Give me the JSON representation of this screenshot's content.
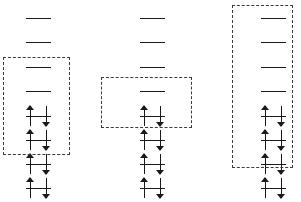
{
  "figure": {
    "width": 301,
    "height": 202,
    "background_color": "#ffffff",
    "line_color": "#1a1a1a",
    "dash_color": "#3a3a3a",
    "level_count_per_column": 8,
    "level_spacing_px": 24.3,
    "level_y_positions": [
      18,
      42,
      67,
      91,
      116,
      140,
      164,
      188
    ],
    "occupancy_legend": {
      "empty": "horizontal line with no electrons",
      "paired": "horizontal line crossed by one up-spin and one down-spin arrow"
    }
  },
  "columns": [
    {
      "id": "column-1",
      "label": "Diagram 1",
      "center_x": 38,
      "line_width": 25,
      "levels": [
        {
          "index": 1,
          "occupancy": "empty",
          "electrons": 0,
          "spins": ""
        },
        {
          "index": 2,
          "occupancy": "empty",
          "electrons": 0,
          "spins": ""
        },
        {
          "index": 3,
          "occupancy": "empty",
          "electrons": 0,
          "spins": ""
        },
        {
          "index": 4,
          "occupancy": "empty",
          "electrons": 0,
          "spins": ""
        },
        {
          "index": 5,
          "occupancy": "paired",
          "electrons": 2,
          "spins": "up-down"
        },
        {
          "index": 6,
          "occupancy": "paired",
          "electrons": 2,
          "spins": "up-down"
        },
        {
          "index": 7,
          "occupancy": "paired",
          "electrons": 2,
          "spins": "up-down"
        },
        {
          "index": 8,
          "occupancy": "paired",
          "electrons": 2,
          "spins": "up-down"
        }
      ],
      "selection_box": {
        "x": 3,
        "y": 57,
        "width": 67,
        "height": 98,
        "covers_levels": [
          3,
          4,
          5,
          6
        ],
        "empty_levels_inside": 2,
        "paired_levels_inside": 2
      }
    },
    {
      "id": "column-2",
      "label": "Diagram 2",
      "center_x": 152,
      "line_width": 25,
      "levels": [
        {
          "index": 1,
          "occupancy": "empty",
          "electrons": 0,
          "spins": ""
        },
        {
          "index": 2,
          "occupancy": "empty",
          "electrons": 0,
          "spins": ""
        },
        {
          "index": 3,
          "occupancy": "empty",
          "electrons": 0,
          "spins": ""
        },
        {
          "index": 4,
          "occupancy": "empty",
          "electrons": 0,
          "spins": ""
        },
        {
          "index": 5,
          "occupancy": "paired",
          "electrons": 2,
          "spins": "up-down"
        },
        {
          "index": 6,
          "occupancy": "paired",
          "electrons": 2,
          "spins": "up-down"
        },
        {
          "index": 7,
          "occupancy": "paired",
          "electrons": 2,
          "spins": "up-down"
        },
        {
          "index": 8,
          "occupancy": "paired",
          "electrons": 2,
          "spins": "up-down"
        }
      ],
      "selection_box": {
        "x": 101,
        "y": 77,
        "width": 91,
        "height": 51,
        "covers_levels": [
          4,
          5
        ],
        "empty_levels_inside": 1,
        "paired_levels_inside": 1
      }
    },
    {
      "id": "column-3",
      "label": "Diagram 3",
      "center_x": 273,
      "line_width": 25,
      "levels": [
        {
          "index": 1,
          "occupancy": "empty",
          "electrons": 0,
          "spins": ""
        },
        {
          "index": 2,
          "occupancy": "empty",
          "electrons": 0,
          "spins": ""
        },
        {
          "index": 3,
          "occupancy": "empty",
          "electrons": 0,
          "spins": ""
        },
        {
          "index": 4,
          "occupancy": "empty",
          "electrons": 0,
          "spins": ""
        },
        {
          "index": 5,
          "occupancy": "paired",
          "electrons": 2,
          "spins": "up-down"
        },
        {
          "index": 6,
          "occupancy": "paired",
          "electrons": 2,
          "spins": "up-down"
        },
        {
          "index": 7,
          "occupancy": "paired",
          "electrons": 2,
          "spins": "up-down"
        },
        {
          "index": 8,
          "occupancy": "paired",
          "electrons": 2,
          "spins": "up-down"
        }
      ],
      "selection_box": {
        "x": 232,
        "y": 5,
        "width": 61,
        "height": 163,
        "covers_levels": [
          1,
          2,
          3,
          4,
          5,
          6,
          7
        ],
        "empty_levels_inside": 4,
        "paired_levels_inside": 3
      }
    }
  ]
}
